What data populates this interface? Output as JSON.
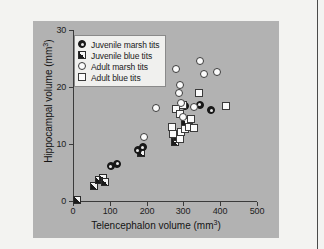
{
  "figure": {
    "panel_bg": "#b2b2b2",
    "page_bg": "#f3f3f1"
  },
  "chart_data": {
    "type": "scatter",
    "title": "",
    "xlabel": "Telencephalon volume (mm³)",
    "ylabel": "Hippocampal volume (mm³)",
    "xlim": [
      0,
      500
    ],
    "ylim": [
      0,
      30
    ],
    "xticks": [
      0,
      100,
      200,
      300,
      400,
      500
    ],
    "yticks": [
      0,
      10,
      20,
      30
    ],
    "grid": false,
    "legend_position": "upper-left",
    "series": [
      {
        "name": "Juvenile marsh tits",
        "marker": "filled-bullseye-circle",
        "color": "#1b1b1b",
        "points": [
          [
            103,
            6.1
          ],
          [
            120,
            6.5
          ],
          [
            176,
            8.9
          ],
          [
            189,
            9.4
          ],
          [
            305,
            16.6
          ],
          [
            345,
            16.9
          ],
          [
            375,
            15.9
          ]
        ]
      },
      {
        "name": "Juvenile blue tits",
        "marker": "diagonal-quartered-square",
        "color": "#1b1b1b",
        "points": [
          [
            10,
            0.2
          ],
          [
            58,
            2.7
          ],
          [
            70,
            3.6
          ],
          [
            82,
            4.1
          ],
          [
            88,
            3.4
          ],
          [
            186,
            8.4
          ],
          [
            277,
            10.3
          ],
          [
            283,
            11.2
          ],
          [
            305,
            13.9
          ]
        ]
      },
      {
        "name": "Adult marsh tits",
        "marker": "open-circle",
        "color": "#fbfbfb",
        "points": [
          [
            192,
            11.2
          ],
          [
            225,
            16.4
          ],
          [
            279,
            23.2
          ],
          [
            288,
            18.9
          ],
          [
            293,
            17.2
          ],
          [
            292,
            20.3
          ],
          [
            300,
            14.8
          ],
          [
            330,
            16.5
          ],
          [
            345,
            24.5
          ],
          [
            355,
            22.3
          ],
          [
            390,
            22.7
          ]
        ]
      },
      {
        "name": "Adult blue tits",
        "marker": "open-square",
        "color": "#fbfbfb",
        "points": [
          [
            270,
            12.9
          ],
          [
            272,
            11.8
          ],
          [
            281,
            16.2
          ],
          [
            290,
            15.2
          ],
          [
            291,
            10.9
          ],
          [
            293,
            12.1
          ],
          [
            300,
            16.9
          ],
          [
            305,
            12.6
          ],
          [
            315,
            13.0
          ],
          [
            322,
            14.4
          ],
          [
            330,
            12.8
          ],
          [
            342,
            18.9
          ],
          [
            415,
            16.6
          ]
        ]
      }
    ]
  },
  "legend": {
    "items": [
      {
        "label": "Juvenile marsh tits",
        "marker": "filled-bullseye-circle"
      },
      {
        "label": "Juvenile blue tits",
        "marker": "diagonal-quartered-square"
      },
      {
        "label": "Adult marsh tits",
        "marker": "open-circle"
      },
      {
        "label": "Adult blue tits",
        "marker": "open-square"
      }
    ]
  },
  "axes": {
    "y_title_main": "Hippocampal volume (mm",
    "y_title_sup": "3",
    "y_title_tail": ")",
    "x_title_main": "Telencephalon volume (mm",
    "x_title_sup": "3",
    "x_title_tail": ")",
    "x_tick_labels": [
      "0",
      "100",
      "200",
      "300",
      "400",
      "500"
    ],
    "y_tick_labels": [
      "0",
      "10",
      "20",
      "30"
    ]
  }
}
